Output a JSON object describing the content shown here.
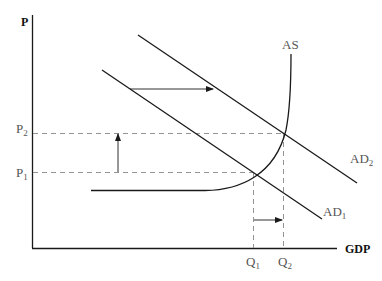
{
  "diagram": {
    "title": "",
    "axes": {
      "y_label": "P",
      "x_label": "GDP"
    },
    "curves": {
      "as_label": "AS",
      "ad1_label": "AD",
      "ad1_sub": "1",
      "ad2_label": "AD",
      "ad2_sub": "2"
    },
    "price_levels": {
      "p1_label": "P",
      "p1_sub": "1",
      "p2_label": "P",
      "p2_sub": "2"
    },
    "quantities": {
      "q1_label": "Q",
      "q1_sub": "1",
      "q2_label": "Q",
      "q2_sub": "2"
    },
    "annotations": [
      "AD shifts right from AD1 to AD2",
      "Price level rises from P1 to P2",
      "Output rises from Q1 to Q2"
    ],
    "colors": {
      "line": "#1a1a1a",
      "dashed": "#777777",
      "label": "#555555"
    }
  }
}
